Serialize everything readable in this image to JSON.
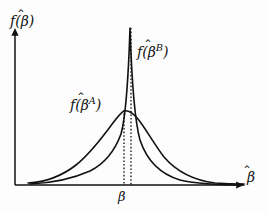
{
  "figure": {
    "background_color": "#fdfdfd",
    "ink_color": "#111111"
  },
  "axes": {
    "y_label_prefix": "f(",
    "y_label_var": "β",
    "y_label_suffix": ")",
    "x_label_var": "β",
    "x_axis_label_full": "β̂",
    "y_axis_label_full": "f(β̂)",
    "origin_x": 15,
    "origin_y": 185,
    "x_axis_end": 245,
    "y_axis_top": 27,
    "grid": false,
    "ticks": []
  },
  "annotations": {
    "curve_a_label_prefix": "f(",
    "curve_a_label_var": "β",
    "curve_a_label_sup": "A",
    "curve_a_label_suffix": ")",
    "curve_a_label_full": "f(β̂ᴬ)",
    "curve_b_label_prefix": "f(",
    "curve_b_label_var": "β",
    "curve_b_label_sup": "B",
    "curve_b_label_suffix": ")",
    "curve_b_label_full": "f(β̂ᴮ)",
    "beta_tick_label": "β"
  },
  "chart_data": {
    "type": "line",
    "title": "",
    "xlabel": "β̂",
    "ylabel": "f(β̂)",
    "xlim": [
      15,
      245
    ],
    "ylim": [
      185,
      27
    ],
    "grid": false,
    "legend_position": "inline-annotations",
    "series": [
      {
        "name": "f(β̂ᴬ)",
        "description": "Broad, flat-peaked sampling distribution of the less efficient estimator A",
        "peak_x": 124,
        "peak_y": 111,
        "peak_height_rel": 0.42,
        "half_width_rel": 1.0,
        "color": "#111111",
        "line_width": 1.6,
        "path": "M 28 183 C 46 182 62 176 76 165 C 90 154 100 140 110 127 C 116 119 120 113 124 111 C 128 110 132 112 138 119 C 146 129 154 144 164 157 C 176 171 192 180 215 183 C 228 184 238 184 244 184"
      },
      {
        "name": "f(β̂ᴮ)",
        "description": "Tall, narrow-peaked sampling distribution of the efficient estimator B",
        "peak_x": 131,
        "peak_y": 27,
        "peak_height_rel": 1.0,
        "half_width_rel": 0.38,
        "color": "#111111",
        "line_width": 1.6,
        "path": "M 30 184 C 52 183 72 179 90 171 C 104 164 114 153 121 134 C 125 120 128 90 130 28 C 132 90 135 122 140 140 C 147 161 160 174 180 180 C 202 185 228 185 244 185"
      }
    ],
    "vertical_reference_lines": [
      {
        "name": "beta-a-reference",
        "x": 124,
        "y_top": 110,
        "y_bottom": 185,
        "style": "dotted"
      },
      {
        "name": "beta-b-reference",
        "x": 131,
        "y_top": 28,
        "y_bottom": 185,
        "style": "dotted"
      }
    ]
  }
}
